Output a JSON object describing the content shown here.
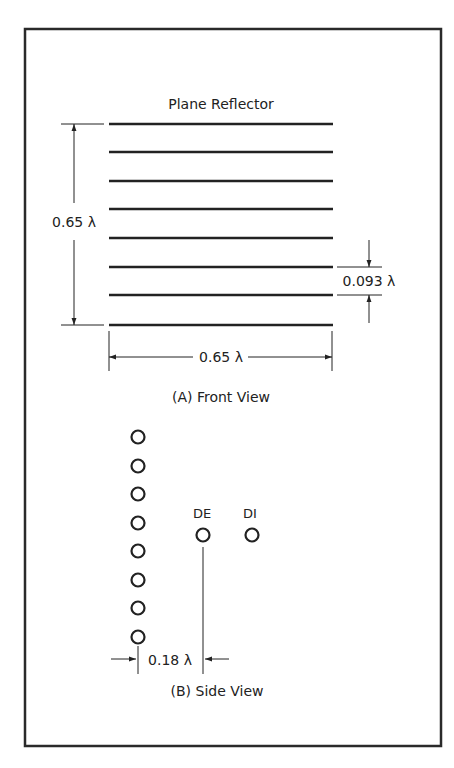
{
  "front_view": {
    "title": "Plane Reflector",
    "height_dim": "0.65 λ",
    "spacing_dim": "0.093 λ",
    "width_dim": "0.65 λ",
    "caption": "(A) Front View",
    "reflector_element_count": 8
  },
  "side_view": {
    "driven_element_label": "DE",
    "director_label": "DI",
    "spacing_dim": "0.18 λ",
    "caption": "(B) Side View",
    "reflector_element_count": 8
  },
  "colors": {
    "line": "#222222",
    "frame": "#2a2a2a",
    "background": "#ffffff"
  }
}
